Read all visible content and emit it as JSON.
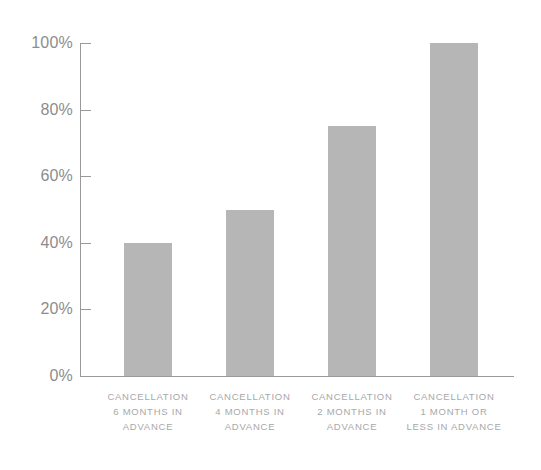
{
  "chart_data": {
    "type": "bar",
    "title": "",
    "subtitle": "",
    "xlabel": "",
    "ylabel": "",
    "ylim": [
      0,
      100
    ],
    "grid": false,
    "legend": false,
    "value_suffix": "%",
    "bar_color": "#b6b6b6",
    "axis_color": "#9a9a9a",
    "tick_label_color": "#8d8d8d",
    "category_label_color": "#a8a8a8",
    "background": "#ffffff",
    "categories": [
      "CANCELLATION 6 MONTHS IN ADVANCE",
      "CANCELLATION 4 MONTHS IN ADVANCE",
      "CANCELLATION 2 MONTHS IN ADVANCE",
      "CANCELLATION 1 MONTH OR LESS IN ADVANCE"
    ],
    "category_lines": [
      [
        "CANCELLATION",
        "6 MONTHS IN",
        "ADVANCE"
      ],
      [
        "CANCELLATION",
        "4 MONTHS IN",
        "ADVANCE"
      ],
      [
        "CANCELLATION",
        "2 MONTHS IN",
        "ADVANCE"
      ],
      [
        "CANCELLATION",
        "1 MONTH OR",
        "LESS IN ADVANCE"
      ]
    ],
    "values": [
      40,
      50,
      75,
      100
    ],
    "yticks": [
      100,
      80,
      60,
      40,
      20,
      0
    ],
    "ytick_labels": [
      "100%",
      "80%",
      "60%",
      "40%",
      "20%",
      "0%"
    ]
  }
}
